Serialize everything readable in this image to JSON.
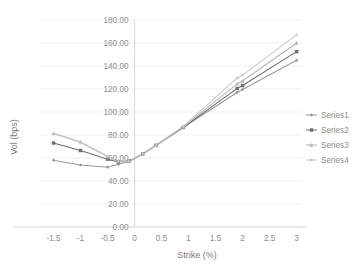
{
  "chart_data": {
    "type": "line",
    "title": "",
    "xlabel": "Strike (%)",
    "ylabel": "Vol (bps)",
    "xlim": [
      -1.75,
      3.1
    ],
    "ylim": [
      0,
      180
    ],
    "xticks": [
      "-1.5",
      "-1",
      "-0.5",
      "0",
      "0.5",
      "1",
      "1.5",
      "2",
      "2.5",
      "3"
    ],
    "xtick_values": [
      -1.5,
      -1,
      -0.5,
      0,
      0.5,
      1,
      1.5,
      2,
      2.5,
      3
    ],
    "yticks": [
      "0.00",
      "20.00",
      "40.00",
      "60.00",
      "80.00",
      "100.00",
      "120.00",
      "140.00",
      "160.00",
      "180.00"
    ],
    "ytick_values": [
      0,
      20,
      40,
      60,
      80,
      100,
      120,
      140,
      160,
      180
    ],
    "grid": true,
    "legend_position": "right",
    "x": [
      -1.5,
      -1.0,
      -0.5,
      -0.3,
      -0.1,
      0.15,
      0.4,
      0.9,
      1.9,
      2.0,
      3.0
    ],
    "series": [
      {
        "name": "Series1",
        "color": "#9a9a9a",
        "marker": "diamond",
        "values": [
          58.0,
          54.0,
          52.0,
          54.5,
          57.0,
          63.5,
          71.0,
          86.5,
          117.0,
          119.5,
          145.0
        ]
      },
      {
        "name": "Series2",
        "color": "#6e6e6e",
        "marker": "square",
        "values": [
          73.0,
          66.5,
          59.0,
          56.5,
          57.5,
          63.5,
          71.0,
          86.5,
          120.5,
          123.0,
          152.5
        ]
      },
      {
        "name": "Series3",
        "color": "#b4b4b4",
        "marker": "triangle",
        "values": [
          81.5,
          74.0,
          61.5,
          57.5,
          57.5,
          63.5,
          71.0,
          87.0,
          124.5,
          127.0,
          160.0
        ]
      },
      {
        "name": "Series4",
        "color": "#c8c8c8",
        "marker": "cross",
        "values": [
          81.0,
          73.5,
          61.0,
          57.0,
          57.5,
          64.0,
          71.5,
          87.5,
          129.5,
          132.0,
          167.0
        ]
      }
    ]
  },
  "legend": {
    "items": [
      {
        "label": "Series1"
      },
      {
        "label": "Series2"
      },
      {
        "label": "Series3"
      },
      {
        "label": "Series4"
      }
    ]
  }
}
